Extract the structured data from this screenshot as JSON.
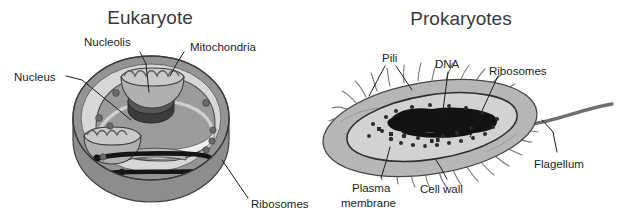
{
  "figure": {
    "type": "biology-diagram",
    "panels": [
      {
        "id": "eukaryote",
        "title": "Eukaryote",
        "labels": [
          {
            "key": "nucleolis",
            "text": "Nucleolis"
          },
          {
            "key": "mitochondria",
            "text": "Mitochondria"
          },
          {
            "key": "nucleus",
            "text": "Nucleus"
          },
          {
            "key": "ribosomes",
            "text": "Ribosomes"
          }
        ]
      },
      {
        "id": "prokaryotes",
        "title": "Prokaryotes",
        "labels": [
          {
            "key": "pili",
            "text": "Pili"
          },
          {
            "key": "dna",
            "text": "DNA"
          },
          {
            "key": "ribosomes",
            "text": "Ribosomes"
          },
          {
            "key": "flagellum",
            "text": "Flagellum"
          },
          {
            "key": "plasma_membrane_line1",
            "text": "Plasma"
          },
          {
            "key": "plasma_membrane_line2",
            "text": "membrane"
          },
          {
            "key": "cell_wall",
            "text": "Cell wall"
          }
        ]
      }
    ],
    "colors": {
      "background": "#ffffff",
      "text": "#1c1c1c",
      "title_text": "#3a3a3a",
      "leader_line": "#1c1c1c",
      "cytoplasm_light": "#d8d8d8",
      "cell_rim_dark": "#8f8f8f",
      "nucleus_mid": "#9c9c9c",
      "nucleolus_dark": "#4e4e4e",
      "organelle_mid": "#a8a8a8",
      "er_black": "#111111",
      "prokaryote_body": "#b4b4b4",
      "prokaryote_inner": "#cdcdcd",
      "dna_black": "#101010",
      "pili_grey": "#777777"
    }
  }
}
